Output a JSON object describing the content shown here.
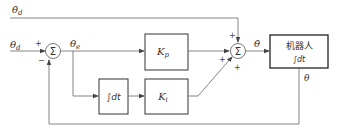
{
  "diagram": {
    "type": "block-diagram",
    "signals": {
      "theta_d_dot": "θ̇",
      "theta_d_dot_sub": "d",
      "theta_d": "θ",
      "theta_d_sub": "d",
      "theta_e": "θ",
      "theta_e_sub": "e",
      "theta_dot": "θ̇",
      "theta_out": "θ"
    },
    "sum1": {
      "symbol": "Σ",
      "plus": "+",
      "minus": "−"
    },
    "sum2": {
      "symbol": "Σ",
      "plus_top": "+",
      "plus_left": "+",
      "plus_bottom": "+"
    },
    "blocks": {
      "kp": {
        "label": "K",
        "sub": "p"
      },
      "integrator": {
        "label": "∫dt"
      },
      "ki": {
        "label": "K",
        "sub": "i"
      },
      "robot": {
        "line1": "机器人",
        "line2": "∫dt"
      }
    },
    "colors": {
      "line": "#555555",
      "box": "#333333",
      "text": "#333333"
    }
  }
}
